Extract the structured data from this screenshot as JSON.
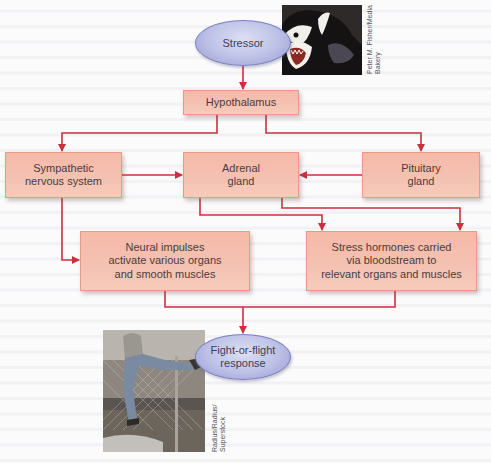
{
  "diagram": {
    "colors": {
      "box_fill": "#f5bfae",
      "box_border": "#e89a88",
      "ellipse_fill": "#bcc0e6",
      "ellipse_border": "#7b80bd",
      "arrow": "#c8323f"
    },
    "nodes": {
      "stressor": "Stressor",
      "hypothalamus": "Hypothalamus",
      "sympathetic": [
        "Sympathetic",
        "nervous system"
      ],
      "adrenal": [
        "Adrenal",
        "gland"
      ],
      "pituitary": [
        "Pituitary",
        "gland"
      ],
      "neural": [
        "Neural impulses",
        "activate various organs",
        "and smooth muscles"
      ],
      "hormones": [
        "Stress hormones carried",
        "via bloodstream to",
        "relevant organs and muscles"
      ],
      "fight_flight": [
        "Fight-or-flight",
        "response"
      ]
    },
    "edges": [
      {
        "from": "Stressor",
        "to": "Hypothalamus"
      },
      {
        "from": "Hypothalamus",
        "to": "Sympathetic nervous system"
      },
      {
        "from": "Hypothalamus",
        "to": "Pituitary gland"
      },
      {
        "from": "Sympathetic nervous system",
        "to": "Adrenal gland"
      },
      {
        "from": "Pituitary gland",
        "to": "Adrenal gland"
      },
      {
        "from": "Sympathetic nervous system",
        "to": "Neural impulses activate various organs and smooth muscles"
      },
      {
        "from": "Adrenal gland",
        "to": "Stress hormones carried via bloodstream to relevant organs and muscles"
      },
      {
        "from": "Neural impulses activate various organs and smooth muscles",
        "to": "Fight-or-flight response"
      },
      {
        "from": "Stress hormones carried via bloodstream to relevant organs and muscles",
        "to": "Fight-or-flight response"
      }
    ],
    "photos": {
      "dog": {
        "subject": "snarling-dog-photo",
        "credit": [
          "Peter M. Fisher/Media",
          "Bakery"
        ]
      },
      "runner": {
        "subject": "person-climbing-fence-photo",
        "credit": [
          "Radius/Radius/",
          "Superstock"
        ]
      }
    }
  }
}
